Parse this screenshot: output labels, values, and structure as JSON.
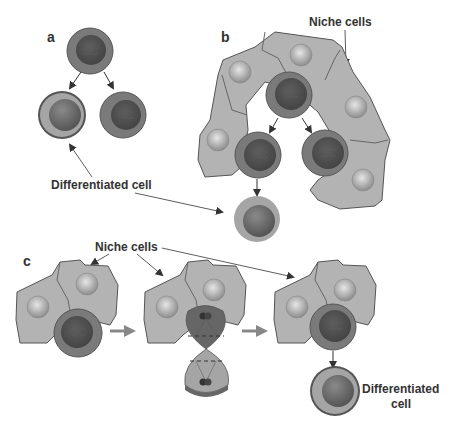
{
  "figure": {
    "panels": {
      "a": "a",
      "b": "b",
      "c": "c"
    },
    "labels": {
      "differentiated_cell_a": "Differentiated cell",
      "niche_cells_b": "Niche cells",
      "niche_cells_c": "Niche cells",
      "differentiated_cell_c_line1": "Differentiated",
      "differentiated_cell_c_line2": "cell"
    },
    "cell_labels": {
      "stem_cell": "SC"
    },
    "colors": {
      "stem_cell_outer": "#7a7a7a",
      "stem_cell_inner": "#555555",
      "diff_cell_outer": "#a5a5a5",
      "diff_cell_inner": "#6d6d6d",
      "niche_cell": "#b3b3b3",
      "niche_nucleus": "#c8c8c8",
      "arrow": "#333333",
      "process_arrow": "#888888"
    }
  }
}
